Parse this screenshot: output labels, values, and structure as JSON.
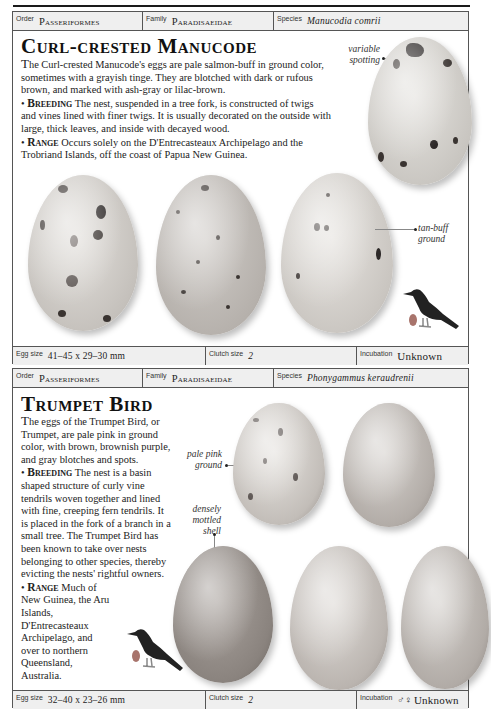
{
  "entries": [
    {
      "order_label": "Order",
      "order": "Passeriformes",
      "family_label": "Family",
      "family": "Paradisaeidae",
      "species_label": "Species",
      "species": "Manucodia comrii",
      "title": "Curl-crested Manucode",
      "description_lead": "T",
      "description": "he Curl-crested Manucode's eggs are pale salmon-buff in ground color, sometimes with a grayish tinge. They are blotched with dark or rufous brown, and marked with ash-gray or lilac-brown.",
      "breeding_label": "Breeding",
      "breeding": "The nest, suspended in a tree fork, is constructed of twigs and vines lined with finer twigs. It is usually decorated on the outside with large, thick leaves, and inside with decayed wood.",
      "range_label": "Range",
      "range": "Occurs solely on the D'Entrecasteaux Archipelago and the Trobriand Islands, off the coast of Papua New Guinea.",
      "callouts": [
        "variable spotting",
        "tan-buff ground"
      ],
      "egg_size_label": "Egg size",
      "egg_size": "41–45 x 29–30 mm",
      "clutch_size_label": "Clutch size",
      "clutch_size": "2",
      "incubation_label": "Incubation",
      "incubation": "Unknown",
      "egg_color": "#d9d6d1",
      "spot_color": "#3a3431"
    },
    {
      "order_label": "Order",
      "order": "Passeriformes",
      "family_label": "Family",
      "family": "Paradisaeidae",
      "species_label": "Species",
      "species": "Phonygammus keraudrenii",
      "title": "Trumpet Bird",
      "description_lead": "T",
      "description": "he eggs of the Trumpet Bird, or Trumpet, are pale pink in ground color, with brown, brownish purple, and gray blotches and spots.",
      "breeding_label": "Breeding",
      "breeding": "The nest is a basin shaped structure of curly vine tendrils woven together and lined with fine, creeping fern tendrils. It is placed in the fork of a branch in a small tree. The Trumpet Bird has been known to take over nests belonging to other species, thereby evicting the nests' rightful owners.",
      "range_label": "Range",
      "range": "Much of New Guinea, the Aru Islands, D'Entrecasteaux Archipelago, and over to northern Queensland, Australia.",
      "callouts": [
        "pale pink ground",
        "densely mottled shell"
      ],
      "egg_size_label": "Egg size",
      "egg_size": "32–40 x 23–26 mm",
      "clutch_size_label": "Clutch size",
      "clutch_size": "2",
      "incubation_label": "Incubation",
      "incubation_symbol": "♂♀",
      "incubation": "Unknown",
      "egg_color": "#c9c5c1",
      "spot_color": "#5a5350"
    }
  ]
}
